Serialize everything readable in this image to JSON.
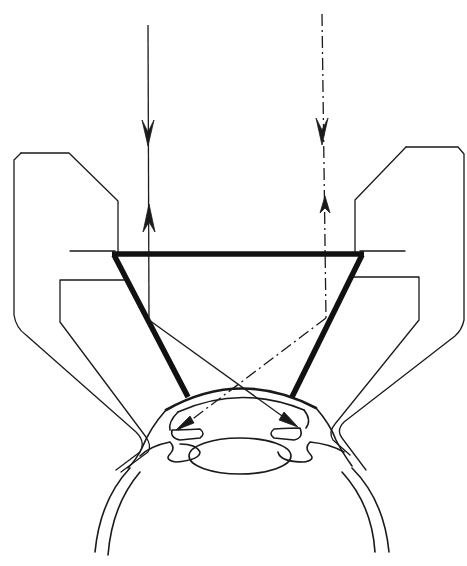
{
  "figure": {
    "description": "Gonioscopy contact lens (goniolens) on eye showing illumination and viewing ray paths to the anterior chamber angle",
    "labels": [],
    "colors": {
      "background": "#ffffff",
      "line": "#1a1a1a"
    },
    "elements": {
      "left_ray": {
        "style": "solid",
        "direction_in": "down",
        "direction_out": "up"
      },
      "right_ray": {
        "style": "dash-dot",
        "direction_in": "down",
        "direction_out": "up"
      },
      "lens": {
        "shape": "inverted truncated cone (trapezoid)",
        "line_weight": "thick"
      },
      "holder": {
        "parts": [
          "left-holder",
          "right-holder"
        ]
      },
      "eye": {
        "parts": [
          "cornea",
          "sclera",
          "iris-left",
          "iris-right",
          "crystalline-lens"
        ]
      }
    }
  }
}
